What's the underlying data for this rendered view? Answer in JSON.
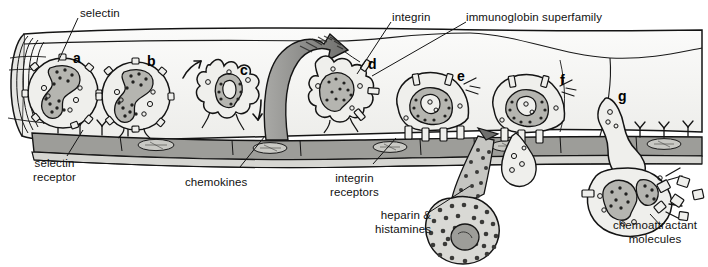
{
  "figure": {
    "type": "biological-diagram"
  },
  "callouts": {
    "selectin": "selectin",
    "integrin": "integrin",
    "immunoglobin_superfamily": "immunoglobin superfamily",
    "selectin_receptor": "selectin\nreceptor",
    "chemokines": "chemokines",
    "integrin_receptors": "integrin\nreceptors",
    "heparin_histamines": "heparin &\nhistamines",
    "chemoattractant_molecules": "chemoattractant\nmolecules"
  },
  "stage_letters": {
    "a": "a",
    "b": "b",
    "c": "c",
    "d": "d",
    "e": "e",
    "f": "f",
    "g": "g"
  },
  "colors": {
    "ink": "#111111",
    "cell_fill": "#eeeeec",
    "nucleus_fill": "#b4b4b0",
    "endothelium_fill": "#9e9e9a",
    "vessel_fill": "#f4f4f2",
    "arrow_fill": "#8c8c8a",
    "mast_fill": "#d8d8d4",
    "granule": "#3a3a38"
  }
}
